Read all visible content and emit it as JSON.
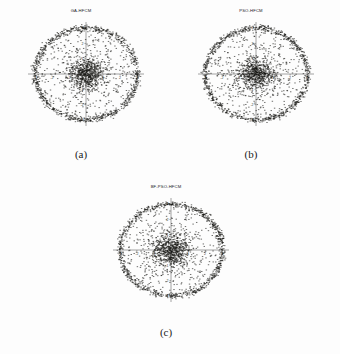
{
  "figure": {
    "background_color": "#fdfdfd",
    "point_color": "#161614",
    "axis_color": "#5a5a58",
    "panels": [
      {
        "id": "a",
        "title": "GA-HFCM",
        "caption": "(a)",
        "seed": 11
      },
      {
        "id": "b",
        "title": "PSO-HFCM",
        "caption": "(b)",
        "seed": 27
      },
      {
        "id": "c",
        "title": "BF-PSO-HFCM",
        "caption": "(c)",
        "seed": 43
      }
    ]
  },
  "chart_data": [
    {
      "type": "scatter",
      "title": "GA-HFCM",
      "caption": "(a)",
      "xlabel": "",
      "ylabel": "",
      "xlim": [
        -3.4,
        3.4
      ],
      "ylim": [
        -3.4,
        3.4
      ],
      "xticks": [
        -3,
        -2,
        -1,
        0,
        1,
        2,
        3
      ],
      "yticks": [
        -3,
        -2,
        -1,
        0,
        1,
        2,
        3
      ],
      "xticklabels": [
        "-3",
        "-2",
        "-1",
        "0",
        "1",
        "2",
        "3"
      ],
      "yticklabels": [
        "-3",
        "-2",
        "-1",
        "0",
        "1",
        "2",
        "3"
      ],
      "grid": false,
      "legend": "none",
      "marker": ".",
      "marker_color": "#161614",
      "n_points": 2000,
      "description": "Two-cluster synthetic dataset: a dense annular ring of points at radius approximately 3.0 plus a dense centrally concentrated blob centred near the origin, with sparse points filling the disc between them.",
      "clusters": [
        {
          "name": "ring",
          "shape": "annulus",
          "center": [
            0,
            0
          ],
          "radius": 3.0,
          "radius_sigma": 0.1,
          "n_points": 900
        },
        {
          "name": "core",
          "shape": "gaussian-blob",
          "center": [
            0,
            0
          ],
          "sigma": 0.55,
          "n_points": 700
        },
        {
          "name": "interior-noise",
          "shape": "uniform-disc",
          "center": [
            0,
            0
          ],
          "radius": 2.85,
          "n_points": 400
        }
      ]
    },
    {
      "type": "scatter",
      "title": "PSO-HFCM",
      "caption": "(b)",
      "xlabel": "",
      "ylabel": "",
      "xlim": [
        -3.4,
        3.4
      ],
      "ylim": [
        -3.4,
        3.4
      ],
      "xticks": [
        -3,
        -2,
        -1,
        0,
        1,
        2,
        3
      ],
      "yticks": [
        -3,
        -2,
        -1,
        0,
        1,
        2,
        3
      ],
      "xticklabels": [
        "-3",
        "-2",
        "-1",
        "0",
        "1",
        "2",
        "3"
      ],
      "yticklabels": [
        "-3",
        "-2",
        "-1",
        "0",
        "1",
        "2",
        "3"
      ],
      "grid": false,
      "legend": "none",
      "marker": ".",
      "marker_color": "#161614",
      "n_points": 2000,
      "description": "Same synthetic dataset clustered by PSO-HFCM: dense ring at radius 3 plus dense central core and sparse interior points.",
      "clusters": [
        {
          "name": "ring",
          "shape": "annulus",
          "center": [
            0,
            0
          ],
          "radius": 3.0,
          "radius_sigma": 0.1,
          "n_points": 900
        },
        {
          "name": "core",
          "shape": "gaussian-blob",
          "center": [
            0,
            0
          ],
          "sigma": 0.55,
          "n_points": 700
        },
        {
          "name": "interior-noise",
          "shape": "uniform-disc",
          "center": [
            0,
            0
          ],
          "radius": 2.85,
          "n_points": 400
        }
      ]
    },
    {
      "type": "scatter",
      "title": "BF-PSO-HFCM",
      "caption": "(c)",
      "xlabel": "",
      "ylabel": "",
      "xlim": [
        -3.4,
        3.4
      ],
      "ylim": [
        -3.4,
        3.4
      ],
      "xticks": [
        -3,
        -2,
        -1,
        0,
        1,
        2,
        3
      ],
      "yticks": [
        -3,
        -2,
        -1,
        0,
        1,
        2,
        3
      ],
      "xticklabels": [
        "-3",
        "-2",
        "-1",
        "0",
        "1",
        "2",
        "3"
      ],
      "yticklabels": [
        "-3",
        "-2",
        "-1",
        "0",
        "1",
        "2",
        "3"
      ],
      "grid": false,
      "legend": "none",
      "marker": ".",
      "marker_color": "#161614",
      "n_points": 2000,
      "description": "Same synthetic dataset clustered by BF-PSO-HFCM: dense ring at radius 3 plus dense central core and sparse interior points.",
      "clusters": [
        {
          "name": "ring",
          "shape": "annulus",
          "center": [
            0,
            0
          ],
          "radius": 3.0,
          "radius_sigma": 0.1,
          "n_points": 900
        },
        {
          "name": "core",
          "shape": "gaussian-blob",
          "center": [
            0,
            0
          ],
          "sigma": 0.55,
          "n_points": 700
        },
        {
          "name": "interior-noise",
          "shape": "uniform-disc",
          "center": [
            0,
            0
          ],
          "radius": 2.85,
          "n_points": 400
        }
      ]
    }
  ]
}
